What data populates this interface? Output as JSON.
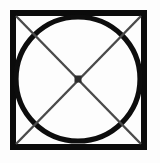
{
  "figure": {
    "background_color": "#fdfdfd",
    "canvas": {
      "width": 160,
      "height": 163
    },
    "square": {
      "label": "outer-square",
      "x": 13,
      "y": 13,
      "width": 131,
      "height": 134,
      "stroke_color": "#0b0b0b",
      "stroke_width": 6,
      "fill": "none"
    },
    "circle": {
      "label": "inscribed-circle",
      "cx": 78,
      "cy": 79,
      "r": 62,
      "stroke_color": "#0d0d0d",
      "stroke_width": 5.2,
      "fill": "none"
    },
    "diagonals": [
      {
        "label": "diagonal-top-left-to-bottom-right",
        "x1": 16,
        "y1": 16,
        "x2": 141,
        "y2": 144,
        "stroke_color": "#4a4a4a",
        "stroke_width": 2.4
      },
      {
        "label": "diagonal-top-right-to-bottom-left",
        "x1": 141,
        "y1": 16,
        "x2": 16,
        "y2": 144,
        "stroke_color": "#4a4a4a",
        "stroke_width": 2.4
      }
    ],
    "center_dot": {
      "label": "center-point",
      "cx": 78,
      "cy": 79,
      "size": 7,
      "fill_color": "#2b2b2b"
    }
  }
}
